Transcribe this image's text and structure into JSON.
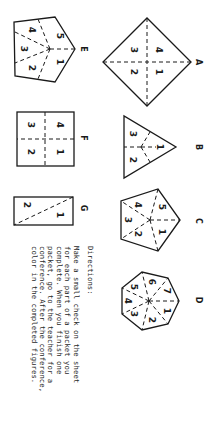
{
  "figures": {
    "A": {
      "label": "A",
      "shape": "diamond",
      "sections": [
        "1",
        "2",
        "3",
        "4"
      ]
    },
    "B": {
      "label": "B",
      "shape": "triangle",
      "sections": [
        "1",
        "2",
        "3"
      ]
    },
    "C": {
      "label": "C",
      "shape": "pentagon",
      "sections": [
        "1",
        "2",
        "3",
        "4",
        "5"
      ]
    },
    "D": {
      "label": "D",
      "shape": "heptagon",
      "sections": [
        "1",
        "2",
        "3",
        "4",
        "5",
        "6",
        "7"
      ]
    },
    "E": {
      "label": "E",
      "shape": "pentagon",
      "sections": [
        "1",
        "2",
        "3",
        "4",
        "5"
      ]
    },
    "F": {
      "label": "F",
      "shape": "square",
      "sections": [
        "1",
        "2",
        "3",
        "4"
      ]
    },
    "G": {
      "label": "G",
      "shape": "rectangle",
      "sections": [
        "1",
        "2"
      ]
    }
  },
  "directions": {
    "title": "Directions:",
    "lines": [
      "Make a small check on the sheet",
      "for each part of a packet you",
      "complete.  When you finish one",
      "packet, go to the teacher for a",
      "conference.  After the conference,",
      "color in the completed figures."
    ]
  },
  "colors": {
    "ink": "#1a1a1a",
    "paper": "#ffffff"
  }
}
